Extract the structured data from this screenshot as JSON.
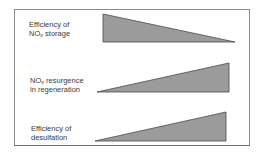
{
  "diagram": {
    "type": "trend-wedges",
    "rows": [
      {
        "label_line1": "Efficiency of",
        "label_line2_prefix": "NO",
        "label_line2_sub": "x",
        "label_line2_suffix": " storage",
        "trend": "decreasing",
        "shape": {
          "points": "103,14 235,42 103,42"
        }
      },
      {
        "label_line1_prefix": "NO",
        "label_line1_sub": "x",
        "label_line1_suffix": " resurgence",
        "label_line2": "in regeneration",
        "trend": "increasing",
        "shape": {
          "points": "97,92 229,63 229,92"
        }
      },
      {
        "label_line1": "Efficiency of",
        "label_line2": "desulfation",
        "trend": "increasing",
        "shape": {
          "points": "95,141 226,112 226,141"
        }
      }
    ],
    "colors": {
      "fill": "#9b9b9b",
      "stroke": "#4a4a4a",
      "frame": "#8a8a8a",
      "text": "#3a3a3a"
    }
  }
}
